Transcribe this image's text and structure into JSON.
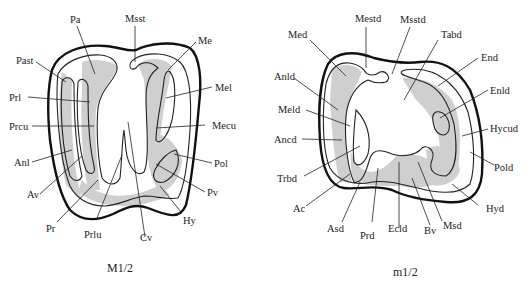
{
  "figure": {
    "panels": [
      {
        "id": "upper",
        "caption": "M1/2",
        "labels": {
          "Pa": "Pa",
          "Msst": "Msst",
          "Me": "Me",
          "Past": "Past",
          "Prl": "Prl",
          "Mel": "Mel",
          "Prcu": "Prcu",
          "Mecu": "Mecu",
          "Anl": "Anl",
          "Pol": "Pol",
          "Av": "Av",
          "Pv": "Pv",
          "Pr": "Pr",
          "Prlu": "Prlu",
          "Cv": "Cv",
          "Hy": "Hy"
        }
      },
      {
        "id": "lower",
        "caption": "m1/2",
        "labels": {
          "Mestd": "Mestd",
          "Msstd": "Msstd",
          "Med": "Med",
          "Tabd": "Tabd",
          "End": "End",
          "Anld": "Anld",
          "Enld": "Enld",
          "Meld": "Meld",
          "Hycud": "Hycud",
          "Ancd": "Ancd",
          "Pold": "Pold",
          "Trbd": "Trbd",
          "Ac": "Ac",
          "Asd": "Asd",
          "Prd": "Prd",
          "Ecld": "Ecld",
          "Bv": "Bv",
          "Msd": "Msd",
          "Hyd": "Hyd"
        }
      }
    ],
    "colors": {
      "outline": "#111111",
      "enamel_shade": "#cfcfcf",
      "background": "#ffffff"
    }
  }
}
